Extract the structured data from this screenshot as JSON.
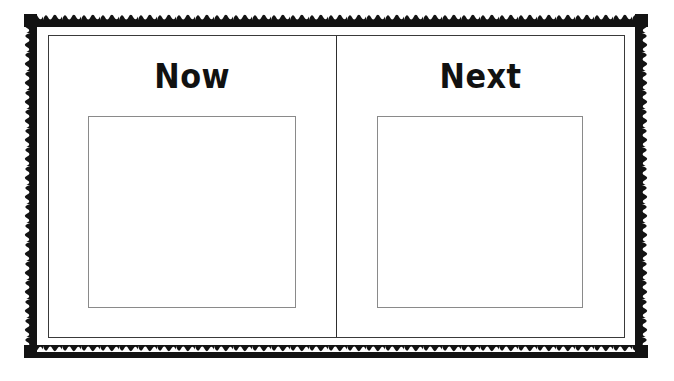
{
  "board": {
    "name": "Now and Next visual schedule board",
    "background_color": "#ffffff",
    "border_color": "#1a1a1a",
    "frame_color": "#3a3a3a",
    "slot_border_color": "#8a8a8a",
    "title_color": "#111111"
  },
  "panels": [
    {
      "key": "now",
      "title": "Now",
      "slot_label": "",
      "slot_placeholder": ""
    },
    {
      "key": "next",
      "title": "Next",
      "slot_label": "",
      "slot_placeholder": ""
    }
  ]
}
